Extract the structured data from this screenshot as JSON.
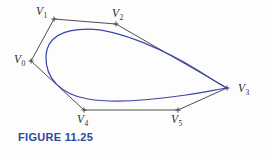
{
  "figure": {
    "caption": "FIGURE 11.25",
    "caption_color": "#2a4a9c",
    "curve_color": "#3a46a8",
    "polygon_color": "#3a3a3a",
    "background": "#fdfdfd"
  },
  "diagram": {
    "type": "bezier-control-polygon",
    "control_points": [
      {
        "label": "V",
        "sub": "0",
        "x": 31,
        "y": 61,
        "label_x": 14,
        "label_y": 54
      },
      {
        "label": "V",
        "sub": "1",
        "x": 54,
        "y": 19,
        "label_x": 36,
        "label_y": 6
      },
      {
        "label": "V",
        "sub": "2",
        "x": 116,
        "y": 24,
        "label_x": 112,
        "label_y": 8
      },
      {
        "label": "V",
        "sub": "3",
        "x": 227,
        "y": 88,
        "label_x": 238,
        "label_y": 83
      },
      {
        "label": "V",
        "sub": "4",
        "x": 84,
        "y": 110,
        "label_x": 77,
        "label_y": 114
      },
      {
        "label": "V",
        "sub": "5",
        "x": 178,
        "y": 110,
        "label_x": 171,
        "label_y": 114
      }
    ],
    "polygon_path": "M 31 61 L 54 19 L 116 24 L 227 88 L 178 110 L 84 110 Z",
    "curve_path": "M 46 56 C 47 36 64 29 88 29 C 120 29 168 52 199 71 C 213 80 223 86 227 88 C 220 89 205 92 186 95 C 152 100 112 103 88 99 C 62 95 45 79 46 56 Z"
  }
}
